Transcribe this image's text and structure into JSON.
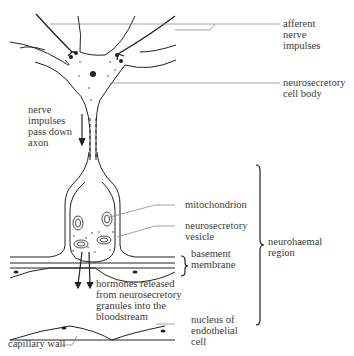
{
  "diagram": {
    "colors": {
      "ink": "#222222",
      "label": "#3a3a3a",
      "leader": "#777777",
      "background": "#ffffff"
    },
    "labels": {
      "afferent": "afferent\nnerve\nimpulses",
      "cell_body": "neurosecretory\ncell body",
      "nerve_impulses": "nerve\nimpulses\npass down\naxon",
      "mitochondrion": "mitochondrion",
      "vesicle": "neurosecretory\nvesicle",
      "basement": "basement\nmembrane",
      "neurohaemal": "neurohaemal\nregion",
      "hormones": "hormones released\nfrom neurosecretory\ngranules into the\nbloodstream",
      "nucleus": "nucleus of\nendothelial\ncell",
      "capillary": "capillary wall"
    }
  }
}
